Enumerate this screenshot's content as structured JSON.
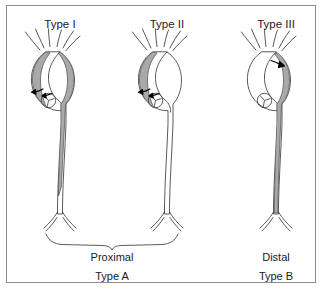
{
  "figure": {
    "kind": "aortic-dissection-classification-diagram",
    "background_color": "#ffffff",
    "border_color": "#8d8d8d",
    "vessel_outline_color": "#4a4a4a",
    "false_lumen_color": "#a9a9a9",
    "tear_arrow_color": "#000000",
    "text_color": "#1b1b1b"
  },
  "panels": [
    {
      "id": "type-1",
      "title": "Type I",
      "title_x": 60,
      "title_y": 25,
      "dissection_extent": "ascending aorta, arch and descending aorta",
      "tear_location": "ascending aorta",
      "false_lumen_shaded": true
    },
    {
      "id": "type-2",
      "title": "Type II",
      "title_x": 167,
      "title_y": 25,
      "dissection_extent": "ascending aorta only",
      "tear_location": "ascending aorta",
      "false_lumen_shaded": true
    },
    {
      "id": "type-3",
      "title": "Type III",
      "title_x": 276,
      "title_y": 25,
      "dissection_extent": "descending aorta distal to left subclavian artery",
      "tear_location": "proximal descending aorta",
      "false_lumen_shaded": true
    }
  ],
  "groups": [
    {
      "id": "proximal-group",
      "line1": "Proximal",
      "line2": "Type A",
      "line1_x": 112,
      "line1_y": 258,
      "line2_x": 112,
      "line2_y": 277,
      "covers": [
        "Type I",
        "Type II"
      ],
      "brace": true
    },
    {
      "id": "distal-group",
      "line1": "Distal",
      "line2": "Type B",
      "line1_x": 276,
      "line1_y": 258,
      "line2_x": 276,
      "line2_y": 277,
      "covers": [
        "Type III"
      ],
      "brace": false
    }
  ]
}
